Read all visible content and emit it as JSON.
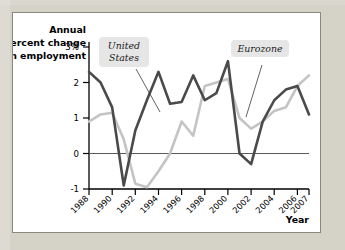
{
  "figure": {
    "panel_background": "#ffffff",
    "page_background": "#d5d2c8",
    "border_color": "#8a8780"
  },
  "chart_data": {
    "type": "line",
    "title": "",
    "ylabel_lines": [
      "Annual",
      "percent change",
      "in employment"
    ],
    "ylabel": "Annual percent change in employment",
    "xlabel": "Year",
    "grid": false,
    "zero_line": true,
    "legend_position": "inline-annotations",
    "x": [
      1988,
      1989,
      1990,
      1991,
      1992,
      1993,
      1994,
      1995,
      1996,
      1997,
      1998,
      1999,
      2000,
      2001,
      2002,
      2003,
      2004,
      2005,
      2006,
      2007
    ],
    "xlim": [
      1988,
      2007
    ],
    "ylim": [
      -1,
      3
    ],
    "ytick_labels": [
      "3%",
      "2",
      "1",
      "0",
      "-1"
    ],
    "ytick_values": [
      3,
      2,
      1,
      0,
      -1
    ],
    "xtick_labels": [
      "1988",
      "1990",
      "1992",
      "1994",
      "1996",
      "1998",
      "2000",
      "2002",
      "2004",
      "2006",
      "2007"
    ],
    "xtick_values": [
      1988,
      1990,
      1992,
      1994,
      1996,
      1998,
      2000,
      2002,
      2004,
      2006,
      2007
    ],
    "series": [
      {
        "name": "United States",
        "color": "#4a4a4a",
        "label_line1": "United",
        "label_line2": "States",
        "values": [
          2.3,
          2.0,
          1.3,
          -0.9,
          0.65,
          1.5,
          2.3,
          1.4,
          1.45,
          2.2,
          1.5,
          1.7,
          2.6,
          0.0,
          -0.3,
          0.9,
          1.5,
          1.8,
          1.9,
          1.1
        ]
      },
      {
        "name": "Eurozone",
        "color": "#c4c4c4",
        "label_line1": "Eurozone",
        "label_line2": "",
        "values": [
          0.9,
          1.1,
          1.15,
          0.4,
          -0.85,
          -0.95,
          -0.5,
          0.0,
          0.9,
          0.5,
          1.9,
          2.0,
          2.1,
          1.0,
          0.7,
          0.9,
          1.2,
          1.3,
          1.9,
          2.2
        ]
      }
    ],
    "annotations": [
      {
        "text": "United States",
        "leader_line": true
      },
      {
        "text": "Eurozone",
        "leader_line": true
      }
    ]
  }
}
